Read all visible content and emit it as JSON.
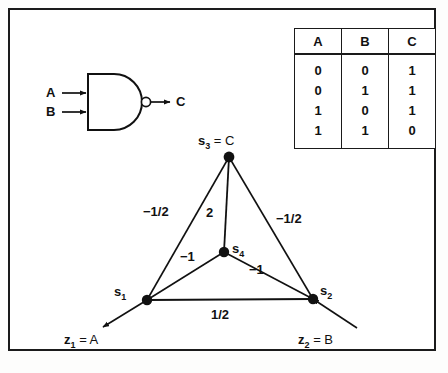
{
  "figure": {
    "background_color": "#ffffff",
    "ink_color": "#111111"
  },
  "logic_gate": {
    "type": "NAND",
    "input_a_label": "A",
    "input_b_label": "B",
    "output_label": "C",
    "has_inversion_bubble": true
  },
  "truth_table": {
    "headers": [
      "A",
      "B",
      "C"
    ],
    "rows": [
      [
        "0",
        "0",
        "1"
      ],
      [
        "0",
        "1",
        "1"
      ],
      [
        "1",
        "0",
        "1"
      ],
      [
        "1",
        "1",
        "0"
      ]
    ]
  },
  "network": {
    "nodes": [
      {
        "id": "s1",
        "symbol": "s",
        "index": "1",
        "equals": "",
        "x": 147,
        "y": 300
      },
      {
        "id": "s2",
        "symbol": "s",
        "index": "2",
        "equals": "",
        "x": 313,
        "y": 299
      },
      {
        "id": "s3",
        "symbol": "s",
        "index": "3",
        "equals": " = C",
        "x": 229,
        "y": 157
      },
      {
        "id": "s4",
        "symbol": "s",
        "index": "4",
        "equals": "",
        "x": 224,
        "y": 252
      }
    ],
    "node_labels": {
      "s1": "s",
      "s1_sub": "1",
      "s2": "s",
      "s2_sub": "2",
      "s3": "s",
      "s3_sub": "3",
      "s3_eq": " = C",
      "s4": "s",
      "s4_sub": "4"
    },
    "edges": [
      {
        "from": "s1",
        "to": "s3",
        "weight": "−1/2"
      },
      {
        "from": "s3",
        "to": "s4",
        "weight": "2"
      },
      {
        "from": "s3",
        "to": "s2",
        "weight": "−1/2"
      },
      {
        "from": "s1",
        "to": "s4",
        "weight": "−1"
      },
      {
        "from": "s4",
        "to": "s2",
        "weight": "−1"
      },
      {
        "from": "s1",
        "to": "s2",
        "weight": "1/2"
      }
    ],
    "inputs": [
      {
        "id": "z1",
        "symbol": "z",
        "index": "1",
        "equals": " = A",
        "target": "s1"
      },
      {
        "id": "z2",
        "symbol": "z",
        "index": "2",
        "equals": " = B",
        "target": "s2"
      }
    ],
    "input_labels": {
      "z1": "z",
      "z1_sub": "1",
      "z1_eq": " = A",
      "z2": "z",
      "z2_sub": "2",
      "z2_eq": " = B"
    }
  }
}
